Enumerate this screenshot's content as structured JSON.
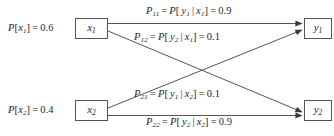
{
  "diagram": {
    "background_color": "#ffffff",
    "line_color": "#555555",
    "text_color": "#262626",
    "input_nodes": [
      {
        "id": "x1",
        "box_label_base": "x",
        "box_label_sub": "1",
        "prior_P": "P",
        "prior_open": "[",
        "prior_var_base": "x",
        "prior_var_sub": "1",
        "prior_close": "]",
        "prior_eq": "=",
        "prior_value": "0.6"
      },
      {
        "id": "x2",
        "box_label_base": "x",
        "box_label_sub": "2",
        "prior_P": "P",
        "prior_open": "[",
        "prior_var_base": "x",
        "prior_var_sub": "2",
        "prior_close": "]",
        "prior_eq": "=",
        "prior_value": "0.4"
      }
    ],
    "output_nodes": [
      {
        "id": "y1",
        "box_label_base": "y",
        "box_label_sub": "1"
      },
      {
        "id": "y2",
        "box_label_base": "y",
        "box_label_sub": "2"
      }
    ],
    "edges": [
      {
        "id": "p11",
        "from": "x1",
        "to": "y1",
        "sym_P": "P",
        "sym_sub": "11",
        "eq1": "=",
        "cond_P": "P",
        "cond_open": "[",
        "cond_out_base": "y",
        "cond_out_sub": "1",
        "cond_bar": "|",
        "cond_in_base": "x",
        "cond_in_sub": "1",
        "cond_close": "]",
        "eq2": "=",
        "value": "0.9"
      },
      {
        "id": "p12",
        "from": "x1",
        "to": "y2",
        "sym_P": "P",
        "sym_sub": "12",
        "eq1": "=",
        "cond_P": "P",
        "cond_open": "[",
        "cond_out_base": "y",
        "cond_out_sub": "2",
        "cond_bar": "|",
        "cond_in_base": "x",
        "cond_in_sub": "1",
        "cond_close": "]",
        "eq2": "=",
        "value": "0.1"
      },
      {
        "id": "p21",
        "from": "x2",
        "to": "y1",
        "sym_P": "P",
        "sym_sub": "21",
        "eq1": "=",
        "cond_P": "P",
        "cond_open": "[",
        "cond_out_base": "y",
        "cond_out_sub": "1",
        "cond_bar": "|",
        "cond_in_base": "x",
        "cond_in_sub": "2",
        "cond_close": "]",
        "eq2": "=",
        "value": "0.1"
      },
      {
        "id": "p22",
        "from": "x2",
        "to": "y2",
        "sym_P": "P",
        "sym_sub": "22",
        "eq1": "=",
        "cond_P": "P",
        "cond_open": "[",
        "cond_out_base": "y",
        "cond_out_sub": "2",
        "cond_bar": "|",
        "cond_in_base": "x",
        "cond_in_sub": "2",
        "cond_close": "]",
        "eq2": "=",
        "value": "0.9"
      }
    ]
  }
}
